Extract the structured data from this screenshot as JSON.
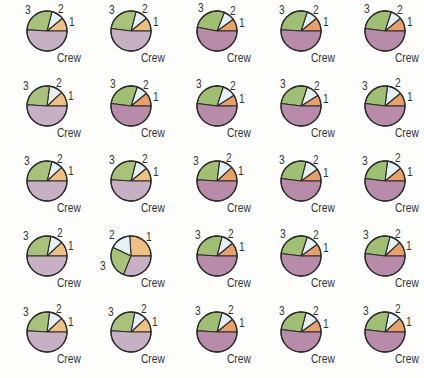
{
  "chart_data": {
    "type": "pie",
    "title": "",
    "layout": {
      "rows": 5,
      "cols": 5,
      "grid": false,
      "legend": "none (inline slice labels)"
    },
    "slice_labels": [
      "1",
      "2",
      "3",
      "Crew"
    ],
    "colors": {
      "light": {
        "1": "#efc07f",
        "2": "#e6f1f6",
        "3": "#a9c27a",
        "Crew": "#c7afc4"
      },
      "dark": {
        "1": "#e9a067",
        "2": "#e6f1f6",
        "3": "#9fbf72",
        "Crew": "#b88bab"
      },
      "outline": "#2b2b2b"
    },
    "pies": [
      {
        "row": 1,
        "col": 1,
        "tone": "light",
        "values": {
          "1": 11,
          "2": 10,
          "3": 28,
          "Crew": 51
        }
      },
      {
        "row": 1,
        "col": 2,
        "tone": "light",
        "values": {
          "1": 11,
          "2": 10,
          "3": 27,
          "Crew": 52
        }
      },
      {
        "row": 1,
        "col": 3,
        "tone": "dark",
        "values": {
          "1": 10,
          "2": 9,
          "3": 28,
          "Crew": 53
        }
      },
      {
        "row": 1,
        "col": 4,
        "tone": "dark",
        "values": {
          "1": 11,
          "2": 9,
          "3": 29,
          "Crew": 51
        }
      },
      {
        "row": 1,
        "col": 5,
        "tone": "dark",
        "values": {
          "1": 11,
          "2": 9,
          "3": 28,
          "Crew": 52
        }
      },
      {
        "row": 2,
        "col": 1,
        "tone": "light",
        "values": {
          "1": 12,
          "2": 11,
          "3": 26,
          "Crew": 51
        }
      },
      {
        "row": 2,
        "col": 2,
        "tone": "dark",
        "values": {
          "1": 11,
          "2": 9,
          "3": 28,
          "Crew": 52
        }
      },
      {
        "row": 2,
        "col": 3,
        "tone": "dark",
        "values": {
          "1": 9,
          "2": 11,
          "3": 28,
          "Crew": 52
        }
      },
      {
        "row": 2,
        "col": 4,
        "tone": "dark",
        "values": {
          "1": 9,
          "2": 11,
          "3": 28,
          "Crew": 52
        }
      },
      {
        "row": 2,
        "col": 5,
        "tone": "dark",
        "values": {
          "1": 11,
          "2": 12,
          "3": 25,
          "Crew": 52
        }
      },
      {
        "row": 3,
        "col": 1,
        "tone": "light",
        "values": {
          "1": 12,
          "2": 9,
          "3": 29,
          "Crew": 50
        }
      },
      {
        "row": 3,
        "col": 2,
        "tone": "light",
        "values": {
          "1": 11,
          "2": 10,
          "3": 28,
          "Crew": 51
        }
      },
      {
        "row": 3,
        "col": 3,
        "tone": "dark",
        "values": {
          "1": 12,
          "2": 11,
          "3": 26,
          "Crew": 51
        }
      },
      {
        "row": 3,
        "col": 4,
        "tone": "dark",
        "values": {
          "1": 10,
          "2": 11,
          "3": 27,
          "Crew": 52
        }
      },
      {
        "row": 3,
        "col": 5,
        "tone": "dark",
        "values": {
          "1": 11,
          "2": 12,
          "3": 25,
          "Crew": 52
        }
      },
      {
        "row": 4,
        "col": 1,
        "tone": "light",
        "values": {
          "1": 12,
          "2": 10,
          "3": 28,
          "Crew": 50
        }
      },
      {
        "row": 4,
        "col": 2,
        "tone": "light",
        "values": {
          "1": 26,
          "2": 17,
          "3": 26,
          "Crew": 31
        }
      },
      {
        "row": 4,
        "col": 3,
        "tone": "dark",
        "values": {
          "1": 11,
          "2": 10,
          "3": 28,
          "Crew": 51
        }
      },
      {
        "row": 4,
        "col": 4,
        "tone": "dark",
        "values": {
          "1": 10,
          "2": 10,
          "3": 28,
          "Crew": 52
        }
      },
      {
        "row": 4,
        "col": 5,
        "tone": "dark",
        "values": {
          "1": 12,
          "2": 9,
          "3": 27,
          "Crew": 52
        }
      },
      {
        "row": 5,
        "col": 1,
        "tone": "light",
        "values": {
          "1": 12,
          "2": 11,
          "3": 26,
          "Crew": 51
        }
      },
      {
        "row": 5,
        "col": 2,
        "tone": "light",
        "values": {
          "1": 12,
          "2": 10,
          "3": 27,
          "Crew": 51
        }
      },
      {
        "row": 5,
        "col": 3,
        "tone": "dark",
        "values": {
          "1": 11,
          "2": 10,
          "3": 28,
          "Crew": 51
        }
      },
      {
        "row": 5,
        "col": 4,
        "tone": "dark",
        "values": {
          "1": 10,
          "2": 11,
          "3": 27,
          "Crew": 52
        }
      },
      {
        "row": 5,
        "col": 5,
        "tone": "dark",
        "values": {
          "1": 12,
          "2": 10,
          "3": 26,
          "Crew": 52
        }
      }
    ],
    "positions": {
      "col_centers_x": [
        47,
        131,
        217,
        301,
        385
      ],
      "row_centers_y": [
        31,
        106,
        181,
        256,
        332
      ],
      "radius": 20
    }
  }
}
